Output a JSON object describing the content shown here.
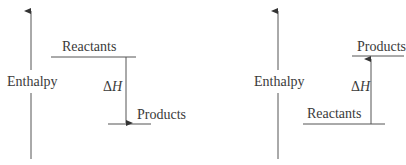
{
  "diagrams": [
    {
      "id": "exothermic",
      "axis_label": "Enthalpy",
      "upper_level": {
        "label": "Reactants"
      },
      "lower_level": {
        "label": "Products"
      },
      "delta": {
        "symbol": "Δ",
        "variable": "H"
      },
      "arrow_direction": "down"
    },
    {
      "id": "endothermic",
      "axis_label": "Enthalpy",
      "upper_level": {
        "label": "Products"
      },
      "lower_level": {
        "label": "Reactants"
      },
      "delta": {
        "symbol": "Δ",
        "variable": "H"
      },
      "arrow_direction": "up"
    }
  ],
  "colors": {
    "line": "#555555",
    "text": "#3a3a3a",
    "background": "#ffffff"
  }
}
